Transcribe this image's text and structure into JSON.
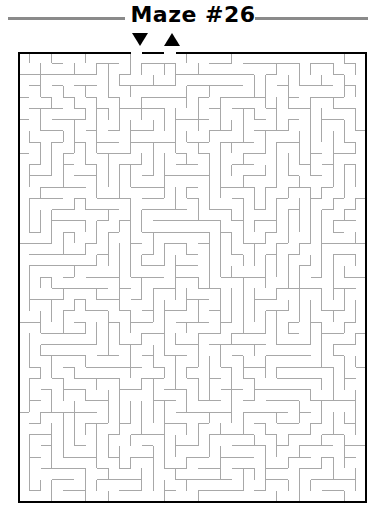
{
  "page": {
    "title": "Maze #26",
    "background_color": "#ffffff"
  },
  "header": {
    "rule_color": "#8a8a8a",
    "title_color": "#000000"
  },
  "markers": {
    "entrance": {
      "name": "entrance-marker",
      "glyph": "down-triangle",
      "color": "#000000",
      "column": 10
    },
    "exit": {
      "name": "exit-marker",
      "glyph": "up-triangle",
      "color": "#000000",
      "column": 13
    }
  },
  "maze": {
    "type": "perfect-maze",
    "columns": 31,
    "rows": 40,
    "cell_size": 11.25,
    "border_color": "#000000",
    "border_width": 2,
    "wall_color": "#a8a8a8",
    "wall_width": 1,
    "background_color": "#ffffff",
    "entrance_column": 10,
    "exit_column": 13,
    "seed": 2616
  }
}
